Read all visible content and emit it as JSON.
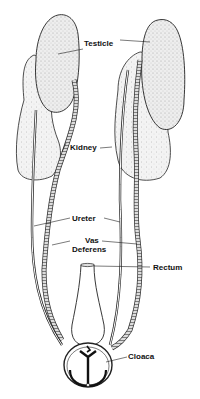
{
  "diagram": {
    "labels": {
      "testicle": "Testicle",
      "kidney": "Kidney",
      "ureter": "Ureter",
      "vas_deferens_line1": "Vas",
      "vas_deferens_line2": "Deferens",
      "rectum": "Rectum",
      "cloaca": "Cloaca"
    },
    "colors": {
      "ink": "#111111",
      "organ_fill": "#e6e6e6",
      "kidney_fill": "#efefef",
      "background": "#ffffff"
    }
  }
}
